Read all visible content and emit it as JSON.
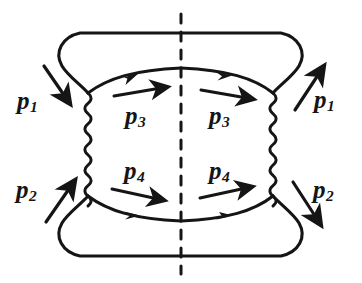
{
  "figure": {
    "kind": "feynman-diagram",
    "line_color": "#151515",
    "background_color": "#ffffff",
    "stroke_width": 3.1
  },
  "labels": {
    "p1_left": {
      "symbol": "p",
      "sub": "1"
    },
    "p1_right": {
      "symbol": "p",
      "sub": "1"
    },
    "p2_left": {
      "symbol": "p",
      "sub": "2"
    },
    "p2_right": {
      "symbol": "p",
      "sub": "2"
    },
    "p3_left": {
      "symbol": "p",
      "sub": "3"
    },
    "p3_right": {
      "symbol": "p",
      "sub": "3"
    },
    "p4_left": {
      "symbol": "p",
      "sub": "4"
    },
    "p4_right": {
      "symbol": "p",
      "sub": "4"
    }
  },
  "elements": {
    "cut_line_name": "dashed-cut-line",
    "photon_left_name": "photon-propagator-left",
    "photon_right_name": "photon-propagator-right",
    "fermion_top_name": "fermion-line-top",
    "fermion_bottom_name": "fermion-line-bottom",
    "loop_top_name": "outer-loop-top",
    "loop_bottom_name": "outer-loop-bottom"
  }
}
